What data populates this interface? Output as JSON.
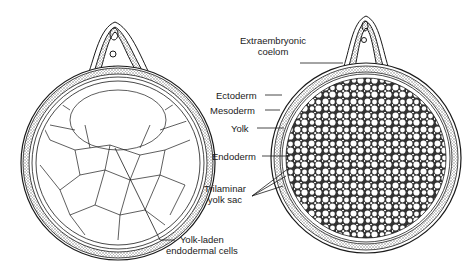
{
  "figure": {
    "left_panel": "Early yolk sac with yolk-laden endodermal cells surrounding a central cavity",
    "right_panel": "Trilaminar yolk sac filled with yolk globules",
    "labels": {
      "extraembryonic_coelom_line1": "Extraembryonic",
      "extraembryonic_coelom_line2": "coelom",
      "ectoderm": "Ectoderm",
      "mesoderm": "Mesoderm",
      "yolk": "Yolk",
      "endoderm": "Endoderm",
      "trilaminar_line1": "Trilaminar",
      "trilaminar_line2": "yolk sac",
      "yolk_laden_line1": "Yolk-laden",
      "yolk_laden_line2": "endodermal cells"
    },
    "colors": {
      "ink": "#1a1a1a",
      "background": "#ffffff",
      "stipple": "#bdbdbd"
    }
  }
}
